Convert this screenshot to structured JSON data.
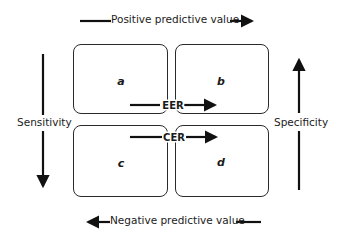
{
  "diagram": {
    "top_label": "Positive predictive value",
    "bottom_label": "Negative predictive value",
    "left_label": "Sensitivity",
    "right_label": "Specificity",
    "cells": {
      "top_left": "a",
      "top_right": "b",
      "bottom_left": "c",
      "bottom_right": "d"
    },
    "rates": {
      "upper": "EER",
      "lower": "CER"
    },
    "arrows": {
      "top": "right-arrow",
      "bottom": "left-arrow",
      "left": "down-arrow",
      "right": "up-arrow",
      "eer": "right-arrow",
      "cer": "right-arrow"
    },
    "colors": {
      "stroke": "#2a2a2a",
      "text": "#222222",
      "background": "#ffffff"
    }
  }
}
